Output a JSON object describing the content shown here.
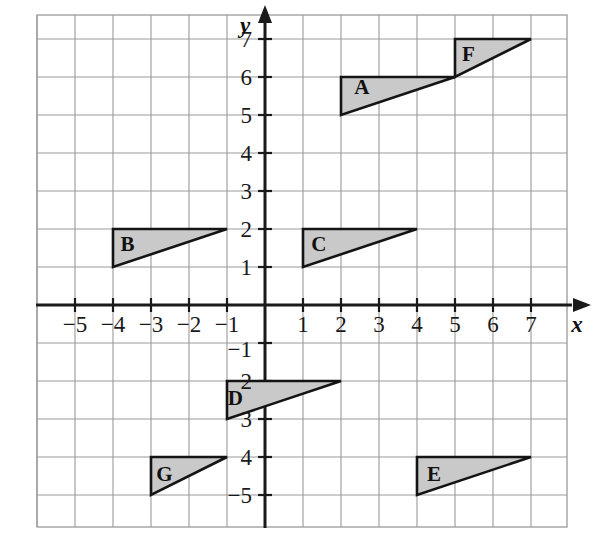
{
  "figure": {
    "type": "coordinate-grid",
    "background_color": "#ffffff",
    "grid_color": "#9a9a9a",
    "axis_color": "#1a1a1a",
    "shape_fill_color": "#c9c9c9",
    "shape_stroke_color": "#141414"
  },
  "axes": {
    "x_axis_name": "x",
    "y_axis_name": "y",
    "x_tick_labels": [
      "−5",
      "−4",
      "−3",
      "−2",
      "−1",
      "1",
      "2",
      "3",
      "4",
      "5",
      "6",
      "7"
    ],
    "x_tick_values": [
      -5,
      -4,
      -3,
      -2,
      -1,
      1,
      2,
      3,
      4,
      5,
      6,
      7
    ],
    "y_tick_labels": [
      "7",
      "6",
      "5",
      "4",
      "3",
      "2",
      "1",
      "−1",
      "2",
      "3",
      "4",
      "−5"
    ],
    "y_tick_values": [
      7,
      6,
      5,
      4,
      3,
      2,
      1,
      -1,
      -2,
      -3,
      -4,
      -5
    ],
    "xlim": [
      -6,
      8
    ],
    "ylim": [
      -7,
      8
    ],
    "grid": true
  },
  "shapes": [
    {
      "label": "A",
      "points": [
        [
          2,
          5
        ],
        [
          2,
          6
        ],
        [
          5,
          6
        ]
      ],
      "label_position": [
        2.55,
        5.55
      ]
    },
    {
      "label": "B",
      "points": [
        [
          -4,
          1
        ],
        [
          -4,
          2
        ],
        [
          -1,
          2
        ]
      ],
      "label_position": [
        -3.62,
        1.42
      ]
    },
    {
      "label": "C",
      "points": [
        [
          1,
          1
        ],
        [
          1,
          2
        ],
        [
          4,
          2
        ]
      ],
      "label_position": [
        1.42,
        1.42
      ]
    },
    {
      "label": "D",
      "points": [
        [
          -1,
          -3
        ],
        [
          -1,
          -2
        ],
        [
          2,
          -2
        ]
      ],
      "label_position": [
        -0.78,
        -2.62
      ]
    },
    {
      "label": "E",
      "points": [
        [
          4,
          -5
        ],
        [
          4,
          -4
        ],
        [
          7,
          -4
        ]
      ],
      "label_position": [
        4.45,
        -4.62
      ]
    },
    {
      "label": "F",
      "points": [
        [
          5,
          6
        ],
        [
          5,
          7
        ],
        [
          7,
          7
        ]
      ],
      "label_position": [
        5.35,
        6.42
      ]
    },
    {
      "label": "G",
      "points": [
        [
          -3,
          -5
        ],
        [
          -3,
          -4
        ],
        [
          -1,
          -4
        ]
      ],
      "label_position": [
        -2.65,
        -4.62
      ]
    }
  ],
  "chart_data": {
    "type": "scatter",
    "title": "",
    "xlabel": "x",
    "ylabel": "y",
    "xlim": [
      -6,
      8
    ],
    "ylim": [
      -7,
      8
    ],
    "grid": true,
    "legend": "none",
    "series": [
      {
        "name": "A",
        "values": [
          [
            2,
            5
          ],
          [
            2,
            6
          ],
          [
            5,
            6
          ]
        ]
      },
      {
        "name": "B",
        "values": [
          [
            -4,
            1
          ],
          [
            -4,
            2
          ],
          [
            -1,
            2
          ]
        ]
      },
      {
        "name": "C",
        "values": [
          [
            1,
            1
          ],
          [
            1,
            2
          ],
          [
            4,
            2
          ]
        ]
      },
      {
        "name": "D",
        "values": [
          [
            -1,
            -3
          ],
          [
            -1,
            -2
          ],
          [
            2,
            -2
          ]
        ]
      },
      {
        "name": "E",
        "values": [
          [
            4,
            -5
          ],
          [
            4,
            -4
          ],
          [
            7,
            -4
          ]
        ]
      },
      {
        "name": "F",
        "values": [
          [
            5,
            6
          ],
          [
            5,
            7
          ],
          [
            7,
            7
          ]
        ]
      },
      {
        "name": "G",
        "values": [
          [
            -3,
            -5
          ],
          [
            -3,
            -4
          ],
          [
            -1,
            -4
          ]
        ]
      }
    ]
  },
  "geometry": {
    "origin_px": [
      265,
      305
    ],
    "unit_px": 38,
    "grid_left_px": 37,
    "grid_top_px": 15,
    "grid_right_px": 567,
    "grid_bottom_px": 527
  }
}
